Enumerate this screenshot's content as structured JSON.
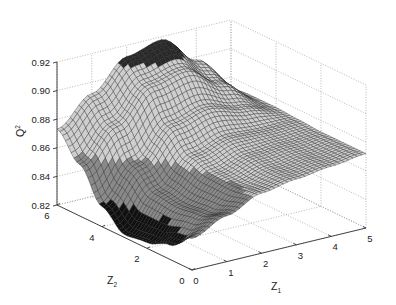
{
  "chart_data": {
    "type": "surface3d",
    "title": "",
    "xlabel": "Z1",
    "ylabel": "Z2",
    "zlabel": "Q2",
    "xlabel_display": {
      "base": "Z",
      "sub": "1"
    },
    "ylabel_display": {
      "base": "Z",
      "sub": "2"
    },
    "zlabel_display": {
      "base": "Q",
      "sup": "2"
    },
    "xlim": [
      0,
      5
    ],
    "ylim": [
      0,
      6
    ],
    "zlim": [
      0.82,
      0.92
    ],
    "x_ticks": [
      "0",
      "1",
      "2",
      "3",
      "4",
      "5"
    ],
    "y_ticks": [
      "0",
      "2",
      "4",
      "6"
    ],
    "z_ticks": [
      "0.82",
      "0.84",
      "0.86",
      "0.88",
      "0.90",
      "0.92"
    ],
    "grid": true,
    "colormap": "gray",
    "surface_description": "Mesh surface of Q2 over Z1 in [0,5], Z2 in [0,6]; minimum ~0.822 near Z1=0, Z2~3; rises to ~0.918 near Z1~3, Z2=6; ~0.873 at Z1=5 edge; ~0.873 at Z1=0,Z2=6",
    "x": [
      0,
      1,
      2,
      3,
      4,
      5
    ],
    "y": [
      0,
      1,
      2,
      3,
      4,
      5,
      6
    ],
    "z": [
      [
        0.842,
        0.852,
        0.862,
        0.866,
        0.869,
        0.872
      ],
      [
        0.83,
        0.846,
        0.86,
        0.866,
        0.869,
        0.872
      ],
      [
        0.824,
        0.844,
        0.861,
        0.868,
        0.87,
        0.872
      ],
      [
        0.822,
        0.846,
        0.866,
        0.873,
        0.872,
        0.873
      ],
      [
        0.834,
        0.858,
        0.88,
        0.886,
        0.88,
        0.874
      ],
      [
        0.856,
        0.878,
        0.9,
        0.905,
        0.89,
        0.874
      ],
      [
        0.873,
        0.892,
        0.912,
        0.918,
        0.898,
        0.873
      ]
    ]
  },
  "projection": {
    "origin_px": [
      192,
      270
    ],
    "x_end_px": [
      366,
      228
    ],
    "y_end_px": [
      57,
      205
    ],
    "z_height_px": 143
  }
}
